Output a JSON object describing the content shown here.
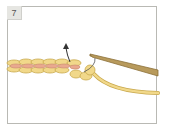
{
  "illustration": {
    "step_number": "7",
    "description": "Crochet chain with hook pulling loop through; arrow pointing up",
    "colors": {
      "frame_border": "#b9b9b4",
      "label_bg": "#e6e6e2",
      "yarn_yellow": "#f1d88a",
      "yarn_outline": "#c9a94e",
      "yarn_pink": "#e9a98e",
      "hook": "#b89a5c",
      "hook_dark": "#8c7038",
      "arrow": "#333333"
    }
  }
}
